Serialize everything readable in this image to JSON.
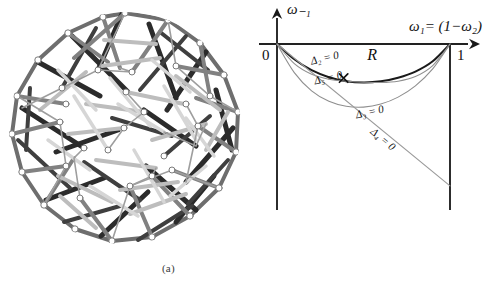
{
  "figure": {
    "panels": [
      {
        "id": "a",
        "caption": "(a)",
        "kind": "tensegrity-sphere-wireframe",
        "description": "Grayscale rendering of a spherical tensegrity / strut-and-cable polyhedral framework"
      },
      {
        "id": "b",
        "caption": "(b)",
        "kind": "plot"
      }
    ]
  },
  "chart_data": {
    "type": "line",
    "title": "",
    "xlabel": "ω₁= (1−ω₂)",
    "ylabel": "ω₋₁",
    "xlim": [
      0,
      1
    ],
    "ylim": [
      -1.05,
      0.12
    ],
    "grid": false,
    "legend_position": "inline-annotations",
    "xticks": [
      {
        "value": 0,
        "label": "0"
      },
      {
        "value": 1,
        "label": "1"
      }
    ],
    "yticks": [],
    "axis_arrows": [
      "x-right",
      "y-up"
    ],
    "region_label": "R",
    "marker": {
      "symbol": "×",
      "name": "curve-intersection-marker",
      "x": 0.385,
      "y": -0.205
    },
    "series": [
      {
        "name": "Δ₂ = 0",
        "label": "Δ₂ = 0",
        "color": "#1a1a1a",
        "width": 2.0,
        "x": [
          0.0,
          0.1,
          0.2,
          0.3,
          0.4,
          0.5,
          0.6,
          0.7,
          0.8,
          0.9,
          1.0
        ],
        "y": [
          0.0,
          -0.092,
          -0.158,
          -0.2,
          -0.224,
          -0.232,
          -0.225,
          -0.203,
          -0.166,
          -0.104,
          0.0
        ]
      },
      {
        "name": "Δ₅ = 0",
        "label": "Δ₅ = 0",
        "color": "#8f8f8f",
        "width": 1.1,
        "x": [
          0.0,
          0.1,
          0.2,
          0.3,
          0.4,
          0.5,
          0.6,
          0.7,
          0.8,
          0.9,
          1.0
        ],
        "y": [
          0.0,
          -0.118,
          -0.182,
          -0.212,
          -0.224,
          -0.23,
          -0.232,
          -0.224,
          -0.196,
          -0.13,
          0.0
        ]
      },
      {
        "name": "Δ₃ = 0",
        "label": "Δ₃ = 0",
        "color": "#8f8f8f",
        "width": 1.1,
        "x": [
          0.0,
          0.1,
          0.2,
          0.3,
          0.4,
          0.5,
          0.6,
          0.7,
          0.8,
          0.9,
          1.0
        ],
        "y": [
          0.0,
          -0.172,
          -0.282,
          -0.345,
          -0.375,
          -0.38,
          -0.362,
          -0.32,
          -0.252,
          -0.15,
          0.0
        ]
      },
      {
        "name": "Δ₄ = 0",
        "label": "Δ₄ = 0",
        "color": "#9a9a9a",
        "width": 1.1,
        "x": [
          0.0,
          1.0
        ],
        "y": [
          0.0,
          -0.855
        ]
      }
    ],
    "annotations": [
      {
        "text": "Δ₂ = 0",
        "x": 0.28,
        "y": -0.105,
        "rotation": -13,
        "name": "delta2-label"
      },
      {
        "text": "Δ₅ = 0",
        "x": 0.3,
        "y": -0.225,
        "rotation": -13,
        "name": "delta5-label"
      },
      {
        "text": "Δ₃ = 0",
        "x": 0.54,
        "y": -0.43,
        "rotation": -13,
        "name": "delta3-label"
      },
      {
        "text": "Δ₄ = 0",
        "x": 0.6,
        "y": -0.59,
        "rotation": 40,
        "name": "delta4-label"
      },
      {
        "text": "R",
        "x": 0.55,
        "y": -0.095,
        "rotation": 0,
        "name": "region-r-label"
      }
    ],
    "boundaries": {
      "left_vertical_x": 0,
      "right_vertical_x": 1,
      "vertical_extent_bottom": -1.0
    }
  }
}
